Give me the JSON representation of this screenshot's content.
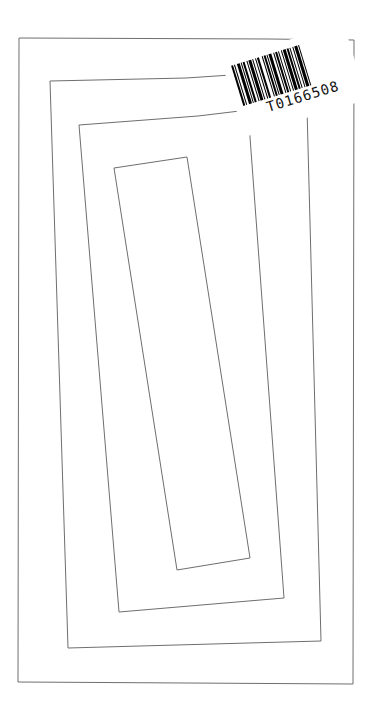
{
  "drawing": {
    "line_color": "#6e6e6e",
    "background": "#ffffff",
    "rectangles": [
      {
        "name": "outer",
        "points": "19,38 269,39 354,40 353,684 18,682"
      },
      {
        "name": "second",
        "points": "50,81 186,78 306,70 321,641 68,648"
      },
      {
        "name": "third",
        "points": "79,125 198,116 248,110 284,598 119,612"
      },
      {
        "name": "inner",
        "points": "114,168 187,157 250,558 177,570"
      }
    ]
  },
  "barcode": {
    "value": "T0166508",
    "bars": [
      2,
      1,
      1,
      2,
      3,
      1,
      1,
      1,
      2,
      2,
      1,
      1,
      3,
      1,
      1,
      2,
      1,
      1,
      2,
      3,
      1,
      1,
      2,
      1,
      1,
      1,
      3,
      2,
      1,
      1,
      2,
      1,
      1,
      2,
      1,
      1,
      3,
      1,
      2,
      1,
      1,
      2,
      1,
      1,
      3,
      1,
      1,
      2
    ]
  }
}
